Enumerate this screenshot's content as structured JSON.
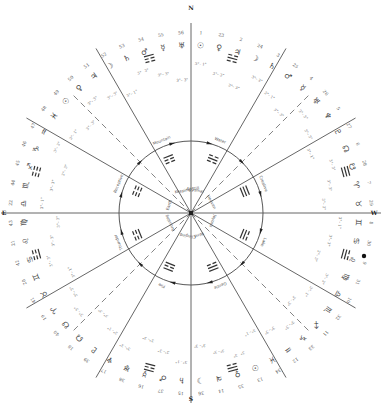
{
  "diagram": {
    "center": [
      191,
      213
    ],
    "inner_radius": 72,
    "compass": [
      {
        "label": "N",
        "angle": -90,
        "r": 205
      },
      {
        "label": "W",
        "angle": 0,
        "r": 183
      },
      {
        "label": "S",
        "angle": 90,
        "r": 186
      },
      {
        "label": "E",
        "angle": 180,
        "r": 187
      }
    ],
    "solid_spokes": [
      -90,
      -60,
      -30,
      0,
      30,
      60,
      90,
      120,
      150,
      180,
      210,
      240
    ],
    "dashed_spokes": [
      -45,
      45,
      135,
      225
    ],
    "spoke_length": 190,
    "trigrams": [
      {
        "name": "Mountain",
        "angle": -112,
        "lines": [
          1,
          0,
          0
        ]
      },
      {
        "name": "Water",
        "angle": -68,
        "lines": [
          0,
          1,
          0
        ]
      },
      {
        "name": "Creative",
        "angle": -22,
        "lines": [
          1,
          1,
          1
        ]
      },
      {
        "name": "Lake",
        "angle": 22,
        "lines": [
          0,
          1,
          1
        ]
      },
      {
        "name": "Gentle",
        "angle": 68,
        "lines": [
          1,
          1,
          0
        ]
      },
      {
        "name": "Fire",
        "angle": 112,
        "lines": [
          1,
          0,
          1
        ]
      },
      {
        "name": "Thunder",
        "angle": 158,
        "lines": [
          0,
          0,
          1
        ]
      },
      {
        "name": "Receptive",
        "angle": 202,
        "lines": [
          0,
          0,
          0
        ]
      }
    ],
    "outer_trigrams": [
      {
        "angle": -105,
        "lines": [
          1,
          0,
          0
        ]
      },
      {
        "angle": -75,
        "lines": [
          0,
          1,
          0
        ]
      },
      {
        "angle": -15,
        "lines": [
          1,
          1,
          1
        ]
      },
      {
        "angle": 15,
        "lines": [
          0,
          1,
          1
        ]
      },
      {
        "angle": 75,
        "lines": [
          1,
          1,
          0
        ]
      },
      {
        "angle": 105,
        "lines": [
          1,
          0,
          1
        ]
      },
      {
        "angle": 165,
        "lines": [
          0,
          0,
          1
        ]
      },
      {
        "angle": 195,
        "lines": [
          0,
          0,
          0
        ]
      }
    ],
    "center_labels": [
      {
        "text": "Keeping Still",
        "angle": -100
      },
      {
        "text": "Abysmal",
        "angle": -80
      },
      {
        "text": "Heaven",
        "angle": -28
      },
      {
        "text": "Joyous",
        "angle": 20
      },
      {
        "text": "Wind",
        "angle": 70
      },
      {
        "text": "Clinging",
        "angle": 98
      },
      {
        "text": "Arousing",
        "angle": 155
      },
      {
        "text": "Earth",
        "angle": 200
      }
    ],
    "glyph_ring": {
      "radius": 168,
      "glyphs": [
        "☉",
        "♀",
        "♃",
        "☽",
        "♄",
        "♂",
        "☿",
        "♅",
        "♆",
        "♇",
        "☊",
        "☋",
        "♈",
        "♉",
        "♊",
        "♋",
        "♌",
        "♍",
        "♎",
        "♏",
        "♐",
        "♑",
        "♒",
        "♓",
        "☉",
        "♀",
        "♃",
        "☽",
        "♄",
        "♂",
        "☿",
        "♅",
        "♆",
        "♇",
        "☊",
        "☋",
        "♈",
        "♉",
        "♊",
        "♋",
        "♌",
        "♍",
        "♎",
        "♏",
        "♐",
        "♑",
        "♒",
        "♓",
        "☉",
        "♀",
        "♃",
        "☽",
        "♄",
        "♂",
        "☿",
        "♅"
      ]
    },
    "number_ring": {
      "radius": 181,
      "numbers": [
        "1",
        "23",
        "2",
        "24",
        "3",
        "25",
        "4",
        "26",
        "5",
        "27",
        "6",
        "28",
        "7",
        "29",
        "8",
        "30",
        "9",
        "31",
        "10",
        "32",
        "11",
        "33",
        "12",
        "34",
        "13",
        "35",
        "14",
        "36",
        "15",
        "37",
        "16",
        "38",
        "17",
        "39",
        "18",
        "40",
        "19",
        "41",
        "20",
        "42",
        "21",
        "43",
        "22",
        "44",
        "45",
        "46",
        "47",
        "48",
        "49",
        "50",
        "51",
        "52",
        "53",
        "54",
        "55",
        "56"
      ]
    },
    "degree_ring": {
      "radius": 140,
      "labels": [
        "3°– 1°",
        "3°– 3°",
        "3°– 3°",
        "3°– 3°",
        "3°– 1°",
        "3°– 3°",
        "3°– 3°",
        "3°– 3°",
        "3°– 1°",
        "3°– 3°",
        "3°– 3°",
        "3°– 3°",
        "3°– 1°",
        "3°– 3°",
        "3°– 3°",
        "3°– 3°",
        "3°– 1°",
        "3°– 3°",
        "3°– 3°",
        "3°– 3°",
        "3°– 1°",
        "3°– 3°",
        "3°– 3°",
        "3°– 3°",
        "3°– 1°",
        "3°– 3°",
        "3°– 3°",
        "3°– 3°",
        "3°– 1°",
        "3°– 3°",
        "3°– 3°",
        "3°– 3°",
        "3°– 1°",
        "3°– 3°",
        "3°– 3°",
        "3°– 3°",
        "3°– 1°",
        "3°– 3°",
        "3°– 3°",
        "3°– 3°",
        "3°– 1°",
        "3°– 3°",
        "3°– 3°",
        "3°– 3°",
        "3°– 1°",
        "3°– 3°",
        "3°– 3°",
        "3°– 3°"
      ]
    },
    "arrows": [
      -105,
      -75,
      -45,
      -15,
      15,
      45,
      75,
      105,
      135,
      165,
      195,
      225
    ],
    "marker_dot": {
      "x": 364,
      "y": 256
    }
  }
}
